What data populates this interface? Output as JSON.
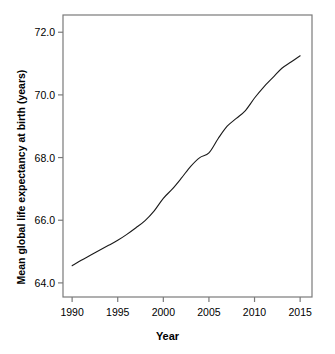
{
  "chart_data": {
    "type": "line",
    "title": "",
    "xlabel": "Year",
    "ylabel": "Mean global life expectancy at birth (years)",
    "xlim": [
      1989.0,
      2016.3
    ],
    "ylim": [
      63.55,
      72.55
    ],
    "grid": false,
    "legend": "none",
    "xticks": [
      "1990",
      "1995",
      "2000",
      "2005",
      "2010",
      "2015"
    ],
    "xtick_values": [
      1990,
      1995,
      2000,
      2005,
      2010,
      2015
    ],
    "yticks": [
      "64.0",
      "66.0",
      "68.0",
      "70.0",
      "72.0"
    ],
    "ytick_values": [
      64.0,
      66.0,
      68.0,
      70.0,
      72.0
    ],
    "line_color": "#1a1a1a",
    "frame_color": "#7a7a7a",
    "series": [
      {
        "name": "Mean global life expectancy at birth",
        "x": [
          1990,
          1991,
          1992,
          1993,
          1994,
          1995,
          1996,
          1997,
          1998,
          1999,
          2000,
          2001,
          2002,
          2003,
          2004,
          2005,
          2006,
          2007,
          2008,
          2009,
          2010,
          2011,
          2012,
          2013,
          2014,
          2015
        ],
        "values": [
          64.55,
          64.72,
          64.88,
          65.04,
          65.2,
          65.36,
          65.55,
          65.76,
          65.99,
          66.3,
          66.7,
          67.0,
          67.35,
          67.72,
          68.0,
          68.15,
          68.6,
          69.0,
          69.25,
          69.5,
          69.9,
          70.25,
          70.55,
          70.85,
          71.05,
          71.25
        ]
      }
    ]
  },
  "axis": {
    "x_title": "Year",
    "y_title": "Mean global life expectancy at birth (years)"
  }
}
